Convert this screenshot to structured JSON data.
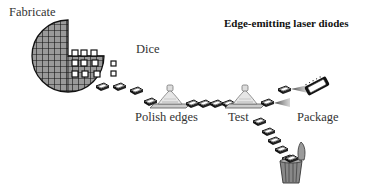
{
  "diagram": {
    "title": "Edge-emitting laser diodes",
    "steps": [
      {
        "id": "fabricate",
        "label": "Fabricate"
      },
      {
        "id": "dice",
        "label": "Dice"
      },
      {
        "id": "polish",
        "label": "Polish edges"
      },
      {
        "id": "test",
        "label": "Test"
      },
      {
        "id": "package",
        "label": "Package"
      }
    ],
    "icons": [
      "wafer-icon",
      "chip-icon",
      "polishing-machine-icon",
      "test-station-icon",
      "laser-beam-icon",
      "packaged-chip-icon",
      "trash-can-icon"
    ]
  }
}
